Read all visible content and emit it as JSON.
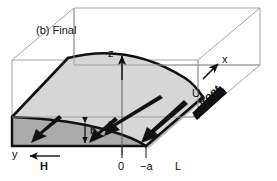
{
  "figure": {
    "caption": "(b) Final",
    "type": "3d-schematic-gravity-current"
  },
  "axes": {
    "z": {
      "label": "z",
      "direction": "up"
    },
    "x": {
      "label": "x",
      "direction": "up-right"
    },
    "y": {
      "label": "y",
      "direction": "left"
    }
  },
  "ticks": {
    "origin": "0",
    "minus_a": "−a",
    "L": "L",
    "H": "H"
  },
  "annotations": {
    "depth": "h",
    "front_velocity_symbol": "U",
    "front_velocity_subscript": "g",
    "front": "front"
  },
  "colors": {
    "box_outline": "#9a9a9a",
    "slab_top": "#d6d6d6",
    "slab_side": "#c9c9c9",
    "slab_front_face": "#a8a8a8",
    "ink": "#111111",
    "background": "#ffffff"
  },
  "geometry": {
    "box_depth_offset_x": 62,
    "box_depth_offset_y": -52
  }
}
